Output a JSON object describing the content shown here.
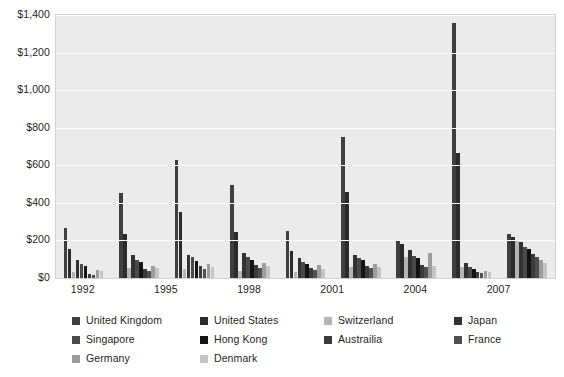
{
  "chart_data": {
    "type": "bar",
    "title": "",
    "subtitle": "",
    "xlabel": "",
    "ylabel": "",
    "ylim": [
      0,
      1400
    ],
    "ytick_values": [
      0,
      200,
      400,
      600,
      800,
      1000,
      1200,
      1400
    ],
    "ytick_labels": [
      "$0",
      "$200",
      "$400",
      "$600",
      "$800",
      "$1,000",
      "$1,200",
      "$1,400"
    ],
    "grid": true,
    "legend_position": "bottom",
    "categories": [
      "1992",
      "1994",
      "1996",
      "1998",
      "2000",
      "2002",
      "2004",
      "2006",
      "2008"
    ],
    "xtick_labels": [
      "1992",
      "1995",
      "1998",
      "2001",
      "2004",
      "2007"
    ],
    "xtick_categories": [
      "1992",
      "1995",
      "1998",
      "2001",
      "2004",
      "2007"
    ],
    "series": [
      {
        "name": "United Kingdom",
        "color": "#3f3f3f",
        "values": [
          268,
          452,
          630,
          495,
          248,
          752,
          196,
          1360,
          232
        ]
      },
      {
        "name": "United States",
        "color": "#2b2b2b",
        "values": [
          152,
          232,
          350,
          245,
          143,
          460,
          182,
          665,
          218
        ]
      },
      {
        "name": "Switzerland",
        "color": "#b4b4b4",
        "values": [
          30,
          55,
          50,
          40,
          30,
          58,
          112,
          60,
          205
        ]
      },
      {
        "name": "Japan",
        "color": "#323232",
        "values": [
          98,
          122,
          122,
          134,
          104,
          120,
          148,
          78,
          190
        ]
      },
      {
        "name": "Singapore",
        "color": "#4a4a4a",
        "values": [
          72,
          98,
          112,
          110,
          86,
          108,
          118,
          60,
          165
        ]
      },
      {
        "name": "Hong Kong",
        "color": "#141414",
        "values": [
          62,
          84,
          88,
          96,
          76,
          96,
          104,
          48,
          152
        ]
      },
      {
        "name": "Australia",
        "color": "#3a3a3a",
        "values": [
          24,
          50,
          62,
          68,
          52,
          66,
          70,
          30,
          128
        ]
      },
      {
        "name": "France",
        "color": "#4f4f4f",
        "values": [
          18,
          40,
          48,
          52,
          44,
          52,
          60,
          26,
          110
        ]
      },
      {
        "name": "Germany",
        "color": "#9c9c9c",
        "values": [
          44,
          62,
          72,
          78,
          68,
          74,
          132,
          40,
          96
        ]
      },
      {
        "name": "Denmark",
        "color": "#c4c4c4",
        "values": [
          36,
          52,
          58,
          62,
          48,
          56,
          64,
          34,
          78
        ]
      }
    ]
  },
  "legend": {
    "rows": [
      [
        {
          "label": "United Kingdom",
          "color": "#3f3f3f"
        },
        {
          "label": "United States",
          "color": "#2b2b2b"
        },
        {
          "label": "Switzerland",
          "color": "#b4b4b4"
        },
        {
          "label": "Japan",
          "color": "#323232"
        }
      ],
      [
        {
          "label": "Singapore",
          "color": "#4a4a4a"
        },
        {
          "label": "Hong Kong",
          "color": "#141414"
        },
        {
          "label": "Austrailia",
          "color": "#3a3a3a"
        },
        {
          "label": "France",
          "color": "#4f4f4f"
        }
      ],
      [
        {
          "label": "Germany",
          "color": "#9c9c9c"
        },
        {
          "label": "Denmark",
          "color": "#c4c4c4"
        }
      ]
    ]
  },
  "colors": {
    "plot_background": "#ebebeb",
    "gridline": "#ffffff",
    "plot_border": "#d2d2d2",
    "text": "#231f20",
    "page_background": "#ffffff"
  }
}
